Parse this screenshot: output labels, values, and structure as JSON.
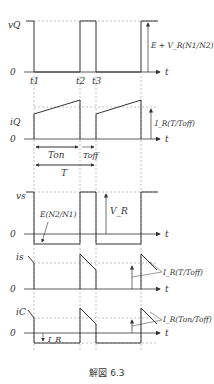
{
  "figure": {
    "caption": "解図 6.3",
    "time_marks": [
      "t1",
      "t2",
      "t3"
    ],
    "axis_label": "t",
    "zero_label": "0"
  },
  "panels": {
    "vQ": {
      "ylabel": "vQ",
      "annotation": "E + V_R(N1/N2)"
    },
    "iQ": {
      "ylabel": "iQ",
      "annotation": "I_R(T/Toff)",
      "intervals": {
        "on": "Ton",
        "off": "Toff",
        "period": "T"
      }
    },
    "vs": {
      "ylabel": "vs",
      "annotation_top": "V_R",
      "annotation_bottom": "E(N2/N1)"
    },
    "is": {
      "ylabel": "is",
      "annotation": "I_R(T/Toff)"
    },
    "iC": {
      "ylabel": "iC",
      "annotation": "I_R(Ton/Toff)",
      "offset_label": "I_R"
    }
  }
}
